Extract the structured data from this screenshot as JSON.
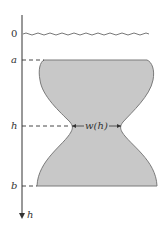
{
  "diagram": {
    "axis": {
      "variable_label": "h",
      "direction": "downward"
    },
    "ticks": [
      {
        "id": "surface",
        "label": "0"
      },
      {
        "id": "top",
        "label": "a"
      },
      {
        "id": "depth",
        "label": "h"
      },
      {
        "id": "bottom",
        "label": "b"
      }
    ],
    "width_label": "w(h)",
    "colors": {
      "shape_fill": "#c8c8c8",
      "shape_stroke": "#7a7a7a",
      "line": "#333333",
      "water_surface": "#555555"
    }
  }
}
